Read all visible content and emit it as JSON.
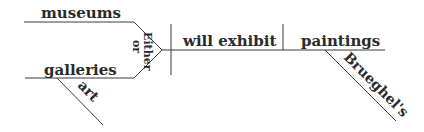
{
  "diagram": {
    "type": "Reed-Kellogg sentence diagram",
    "sentence_parts": {
      "subject_compound": {
        "top": "museums",
        "bottom": "galleries",
        "bottom_modifier": "art",
        "conjunction_top": "Either",
        "conjunction_bottom": "or"
      },
      "verb": "will exhibit",
      "direct_object": "paintings",
      "object_modifier": "Brueghel's"
    },
    "colors": {
      "line": "#3a3a3a",
      "text": "#2a2a2a",
      "background": "#ffffff"
    }
  }
}
